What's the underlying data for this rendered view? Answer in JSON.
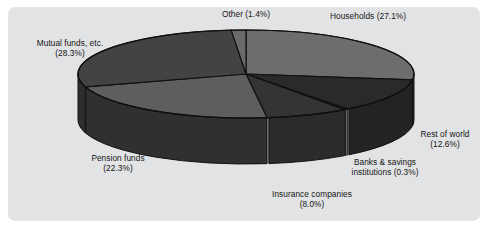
{
  "figure": {
    "background_color": "#ffffff",
    "panel_color": "#e2e3e4",
    "text_color": "#151515"
  },
  "chart_data": {
    "type": "pie",
    "title": "",
    "subtitle": "",
    "xlabel": "",
    "ylabel": "",
    "legend_position": "none",
    "grid": false,
    "three_d": true,
    "start_angle_deg": 0,
    "direction": "clockwise",
    "categories": [
      "Households",
      "Rest of world",
      "Banks & savings institutions",
      "Insurance companies",
      "Pension funds",
      "Mutual funds, etc.",
      "Other"
    ],
    "values": [
      27.1,
      12.6,
      0.3,
      8.0,
      22.3,
      28.3,
      1.4
    ],
    "units": "percent",
    "total": 100.0,
    "slices": [
      {
        "name": "Households",
        "value": 27.1,
        "value_text": "27.1%",
        "label_line1": "Households (27.1%)",
        "label_line2": "",
        "top_color": "#6d6d6d",
        "side_color": "#3c3c3c"
      },
      {
        "name": "Rest of world",
        "value": 12.6,
        "value_text": "12.6%",
        "label_line1": "Rest of world",
        "label_line2": "(12.6%)",
        "top_color": "#2a2a2a",
        "side_color": "#232323"
      },
      {
        "name": "Banks & savings institutions",
        "value": 0.3,
        "value_text": "0.3%",
        "label_line1": "Banks & savings",
        "label_line2": "institutions (0.3%)",
        "top_color": "#9a9a9a",
        "side_color": "#8f8f8f"
      },
      {
        "name": "Insurance companies",
        "value": 8.0,
        "value_text": "8.0%",
        "label_line1": "Insurance companies",
        "label_line2": "(8.0%)",
        "top_color": "#343434",
        "side_color": "#2b2b2b"
      },
      {
        "name": "Pension funds",
        "value": 22.3,
        "value_text": "22.3%",
        "label_line1": "Pension funds",
        "label_line2": "(22.3%)",
        "top_color": "#5e5e5e",
        "side_color": "#303030"
      },
      {
        "name": "Mutual funds, etc.",
        "value": 28.3,
        "value_text": "28.3%",
        "label_line1": "Mutual funds, etc.",
        "label_line2": "(28.3%)",
        "top_color": "#434343",
        "side_color": "#2e2e2e"
      },
      {
        "name": "Other",
        "value": 1.4,
        "value_text": "1.4%",
        "label_line1": "Other (1.4%)",
        "label_line2": "",
        "top_color": "#6a6a6a",
        "side_color": "#3a3a3a"
      }
    ]
  }
}
